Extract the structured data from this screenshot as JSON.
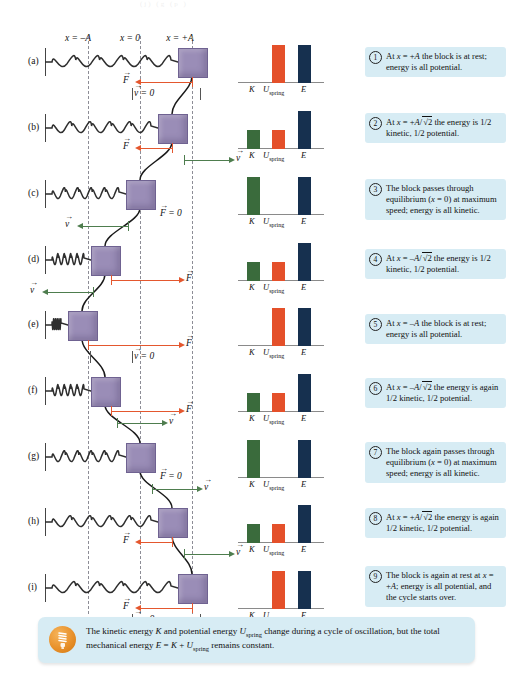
{
  "figure": {
    "axis_labels": [
      {
        "text": "x = –A",
        "x": 78,
        "y": 33
      },
      {
        "text": "x = 0",
        "x": 130,
        "y": 33
      },
      {
        "text": "x = +A",
        "x": 180,
        "y": 33
      }
    ],
    "top_artifact": "(j)                         (g         (p        )"
  },
  "panels": [
    {
      "label": "(a)",
      "block_x": 192,
      "force": "left",
      "force_label": "F",
      "velocity_label": "v = 0"
    },
    {
      "label": "(b)",
      "block_x": 172,
      "force": "left",
      "force_label": "F",
      "velocity_label": "v"
    },
    {
      "label": "(c)",
      "block_x": 140,
      "force": "zero",
      "force_label": "F = 0",
      "velocity_label": "v"
    },
    {
      "label": "(d)",
      "block_x": 105,
      "force": "right",
      "force_label": "F",
      "velocity_label": "v"
    },
    {
      "label": "(e)",
      "block_x": 82,
      "force": "right",
      "force_label": "F",
      "velocity_label": "v = 0"
    },
    {
      "label": "(f)",
      "block_x": 105,
      "force": "right",
      "force_label": "F",
      "velocity_label": "v"
    },
    {
      "label": "(g)",
      "block_x": 140,
      "force": "zero",
      "force_label": "F = 0",
      "velocity_label": "v"
    },
    {
      "label": "(h)",
      "block_x": 172,
      "force": "left",
      "force_label": "F",
      "velocity_label": "v"
    },
    {
      "label": "(i)",
      "block_x": 192,
      "force": "left",
      "force_label": "F",
      "velocity_label": "v = 0"
    }
  ],
  "chart_data": {
    "type": "bar",
    "categories": [
      "K",
      "U_spring",
      "E"
    ],
    "tick_labels": [
      "K",
      "U",
      "spring",
      "E"
    ],
    "ylabel": "",
    "ylim": [
      0,
      1
    ],
    "grid": false,
    "legend": "none",
    "colors": {
      "K": "#3a6b3c",
      "U_spring": "#e4502a",
      "E": "#16304f"
    },
    "panels": [
      {
        "panel": "(a)",
        "values": [
          0.0,
          1.0,
          1.0
        ]
      },
      {
        "panel": "(b)",
        "values": [
          0.5,
          0.5,
          1.0
        ]
      },
      {
        "panel": "(c)",
        "values": [
          1.0,
          0.0,
          1.0
        ]
      },
      {
        "panel": "(d)",
        "values": [
          0.5,
          0.5,
          1.0
        ]
      },
      {
        "panel": "(e)",
        "values": [
          0.0,
          1.0,
          1.0
        ]
      },
      {
        "panel": "(f)",
        "values": [
          0.5,
          0.5,
          1.0
        ]
      },
      {
        "panel": "(g)",
        "values": [
          1.0,
          0.0,
          1.0
        ]
      },
      {
        "panel": "(h)",
        "values": [
          0.5,
          0.5,
          1.0
        ]
      },
      {
        "panel": "(i)",
        "values": [
          0.0,
          1.0,
          1.0
        ]
      }
    ]
  },
  "callouts": [
    {
      "num": "1",
      "html": "At <i>x</i> = +<i>A</i> the block is at rest; energy is all potential."
    },
    {
      "num": "2",
      "html": "At <i>x</i> = +<i>A</i>/<span class=\"rad\">√2</span> the energy is 1/2 kinetic, 1/2 potential."
    },
    {
      "num": "3",
      "html": "The block passes through equilibrium (<i>x</i> = 0) at maximum speed; energy is all kinetic."
    },
    {
      "num": "4",
      "html": "At <i>x</i> = –<i>A</i>/<span class=\"rad\">√2</span> the energy is 1/2 kinetic, 1/2 potential."
    },
    {
      "num": "5",
      "html": "At <i>x</i> = –<i>A</i> the block is at rest; energy is all potential."
    },
    {
      "num": "6",
      "html": "At <i>x</i> = –<i>A</i>/<span class=\"rad\">√2</span> the energy is again 1/2 kinetic, 1/2 potential."
    },
    {
      "num": "7",
      "html": "The block again passes through equilibrium (<i>x</i> = 0) at maximum speed; energy is all kinetic."
    },
    {
      "num": "8",
      "html": "At <i>x</i> = +<i>A</i>/<span class=\"rad\">√2</span> the energy is again 1/2 kinetic, 1/2 potential."
    },
    {
      "num": "9",
      "html": "The block is again at rest at <i>x</i> = +<i>A</i>; energy is all potential, and the cycle starts over."
    }
  ],
  "summary": {
    "icon": "lightbulb-icon",
    "html": "The kinetic energy <i>K</i> and potential energy <i>U</i><sub>spring</sub> change during a cycle of oscillation, but the total mechanical energy <i>E</i> = <i>K</i> + <i>U</i><sub>spring</sub> remains constant."
  }
}
